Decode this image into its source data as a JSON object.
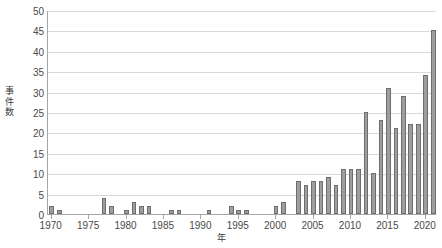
{
  "chart_data": {
    "type": "bar",
    "title": "",
    "xlabel": "年",
    "ylabel": "事件数",
    "ylim": [
      0,
      50
    ],
    "ytick_labels": [
      "0",
      "5",
      "10",
      "15",
      "20",
      "25",
      "30",
      "35",
      "40",
      "45",
      "50"
    ],
    "ytick_values": [
      0,
      5,
      10,
      15,
      20,
      25,
      30,
      35,
      40,
      45,
      50
    ],
    "xtick_labels": [
      "1970",
      "1975",
      "1980",
      "1985",
      "1990",
      "1995",
      "2000",
      "2005",
      "2010",
      "2015",
      "2020"
    ],
    "xtick_values": [
      1970,
      1975,
      1980,
      1985,
      1990,
      1995,
      2000,
      2005,
      2010,
      2015,
      2020
    ],
    "grid": true,
    "legend": false,
    "bar_color": "#9e9e9e",
    "bar_edge_color": "#6e6e6e",
    "categories": [
      1970,
      1971,
      1972,
      1973,
      1974,
      1975,
      1976,
      1977,
      1978,
      1979,
      1980,
      1981,
      1982,
      1983,
      1984,
      1985,
      1986,
      1987,
      1988,
      1989,
      1990,
      1991,
      1992,
      1993,
      1994,
      1995,
      1996,
      1997,
      1998,
      1999,
      2000,
      2001,
      2002,
      2003,
      2004,
      2005,
      2006,
      2007,
      2008,
      2009,
      2010,
      2011,
      2012,
      2013,
      2014,
      2015,
      2016,
      2017,
      2018,
      2019,
      2020,
      2021
    ],
    "values": [
      2,
      1,
      0,
      0,
      0,
      0,
      0,
      4,
      2,
      0,
      1,
      3,
      2,
      2,
      0,
      0,
      1,
      1,
      0,
      0,
      0,
      1,
      0,
      0,
      2,
      1,
      1,
      0,
      0,
      0,
      2,
      3,
      0,
      8,
      7,
      8,
      8,
      9,
      7,
      11,
      11,
      11,
      25,
      10,
      23,
      31,
      21,
      29,
      22,
      22,
      34,
      45
    ]
  }
}
